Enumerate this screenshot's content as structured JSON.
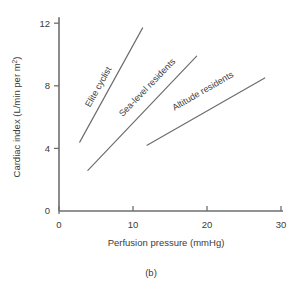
{
  "figure": {
    "caption": "(b)",
    "background_color": "#ffffff",
    "line_color": "#6b6b6b",
    "axis_color": "#6e6e6e",
    "text_color": "#3b3b3b"
  },
  "chart_data": {
    "type": "line",
    "title": "",
    "subtitle": "",
    "xlabel": "Perfusion pressure (mmHg)",
    "ylabel": "Cardiac index (L/min per m²)",
    "ylabel_main": "Cardiac index (L/min per m",
    "ylabel_sup": "2",
    "ylabel_tail": ")",
    "xlim": [
      0,
      30
    ],
    "ylim": [
      0,
      12
    ],
    "xticks": [
      0,
      10,
      20,
      30
    ],
    "xtick_labels": [
      "0",
      "10",
      "20",
      "30"
    ],
    "yticks": [
      0,
      4,
      8,
      12
    ],
    "ytick_labels": [
      "0",
      "4",
      "8",
      "12"
    ],
    "grid": false,
    "legend": "inline-annotations",
    "series": [
      {
        "name": "Elite cyclist",
        "label": "Elite cyclist",
        "x": [
          2.8,
          11.3
        ],
        "y": [
          4.4,
          11.7
        ],
        "label_angle": -60.9,
        "label_x": 4.2,
        "label_y": 6.6
      },
      {
        "name": "Sea-level residents",
        "label": "Sea-level residents",
        "x": [
          3.9,
          18.6
        ],
        "y": [
          2.6,
          9.9
        ],
        "label_angle": -46.0,
        "label_x": 8.6,
        "label_y": 6.0
      },
      {
        "name": "Altitude residents",
        "label": "Altitude residents",
        "x": [
          11.9,
          27.8
        ],
        "y": [
          4.2,
          8.5
        ],
        "label_angle": -30.0,
        "label_x": 15.6,
        "label_y": 6.4
      }
    ]
  }
}
